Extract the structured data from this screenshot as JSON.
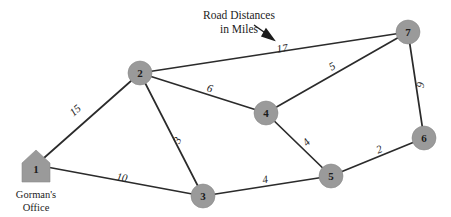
{
  "title": {
    "line1": "Road Distances",
    "line2": "in Miles"
  },
  "annotation": {
    "arrow_icon": "arrow-pointer-icon",
    "points_to": "17"
  },
  "nodes": [
    {
      "id": "1",
      "label": "1",
      "shape": "house",
      "x": 36,
      "y": 165,
      "caption_line1": "Gorman's",
      "caption_line2": "Office"
    },
    {
      "id": "2",
      "label": "2",
      "shape": "circle",
      "x": 140,
      "y": 73
    },
    {
      "id": "3",
      "label": "3",
      "shape": "circle",
      "x": 203,
      "y": 196
    },
    {
      "id": "4",
      "label": "4",
      "shape": "circle",
      "x": 266,
      "y": 113
    },
    {
      "id": "5",
      "label": "5",
      "shape": "circle",
      "x": 331,
      "y": 176
    },
    {
      "id": "6",
      "label": "6",
      "shape": "circle",
      "x": 424,
      "y": 138
    },
    {
      "id": "7",
      "label": "7",
      "shape": "circle",
      "x": 408,
      "y": 32
    }
  ],
  "edges": [
    {
      "from": "1",
      "to": "2",
      "weight": "15",
      "lx": 75,
      "ly": 110,
      "rot": -41
    },
    {
      "from": "1",
      "to": "3",
      "weight": "10",
      "lx": 122,
      "ly": 177,
      "rot": 10
    },
    {
      "from": "2",
      "to": "3",
      "weight": "3",
      "lx": 177,
      "ly": 140,
      "rot": -63
    },
    {
      "from": "2",
      "to": "4",
      "weight": "6",
      "lx": 210,
      "ly": 88,
      "rot": 16
    },
    {
      "from": "2",
      "to": "7",
      "weight": "17",
      "lx": 282,
      "ly": 48,
      "rot": -9
    },
    {
      "from": "3",
      "to": "5",
      "weight": "4",
      "lx": 265,
      "ly": 179,
      "rot": -10
    },
    {
      "from": "4",
      "to": "5",
      "weight": "4",
      "lx": 306,
      "ly": 142,
      "rot": -46
    },
    {
      "from": "4",
      "to": "7",
      "weight": "5",
      "lx": 332,
      "ly": 66,
      "rot": -30
    },
    {
      "from": "5",
      "to": "6",
      "weight": "2",
      "lx": 379,
      "ly": 149,
      "rot": -22
    },
    {
      "from": "6",
      "to": "7",
      "weight": "9",
      "lx": 420,
      "ly": 85,
      "rot": -81
    }
  ],
  "colors": {
    "node_fill": "#9a9a9a",
    "edge_stroke": "#2b2b2b",
    "text": "#1c1c1c",
    "background": "#ffffff"
  },
  "geometry": {
    "node_radius": 12,
    "house_half_width": 14,
    "house_body_height": 17,
    "house_roof_height": 13
  }
}
